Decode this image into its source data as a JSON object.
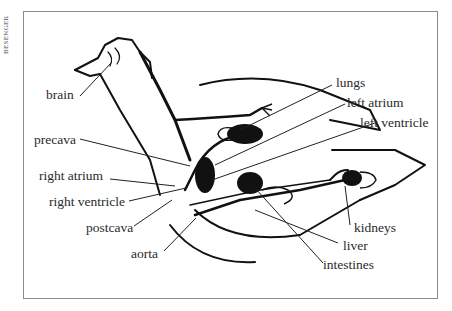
{
  "credit": "BESENGER",
  "figure": {
    "labels": {
      "brain": "brain",
      "lungs": "lungs",
      "left_atrium": "left atrium",
      "left_ventricle": "left ventricle",
      "precava": "precava",
      "right_atrium": "right atrium",
      "right_ventricle": "right ventricle",
      "postcava": "postcava",
      "aorta": "aorta",
      "kidneys": "kidneys",
      "liver": "liver",
      "intestines": "intestines"
    }
  }
}
